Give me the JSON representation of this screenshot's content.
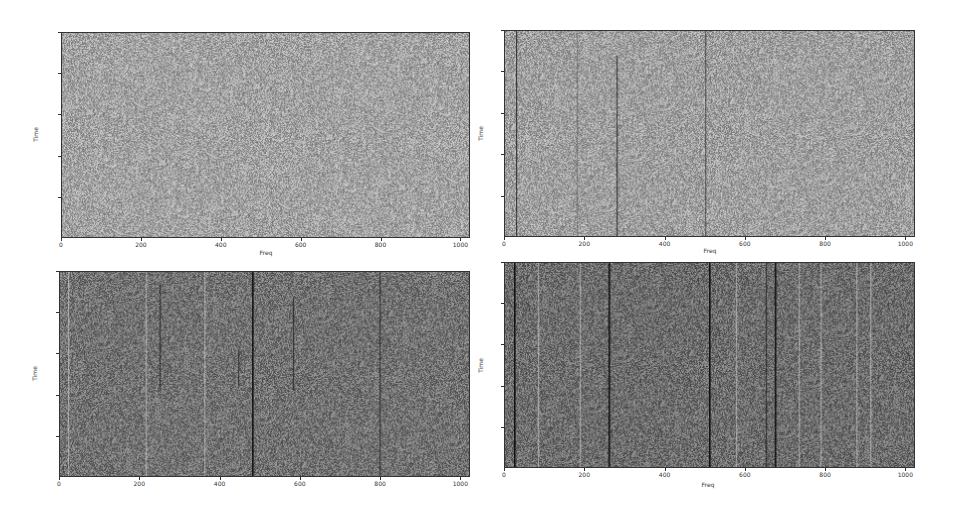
{
  "chart_data": [
    {
      "type": "heatmap",
      "panel": "top-left",
      "title": "",
      "xlabel": "Freq",
      "ylabel": "Time",
      "xlim": [
        0,
        1024
      ],
      "ylim": [
        500,
        0
      ],
      "xticks": [
        0,
        200,
        400,
        600,
        800,
        1000
      ],
      "yticks": [
        0,
        100,
        200,
        300,
        400
      ],
      "colormap": "gray",
      "background_level": "#a3a3a3",
      "description": "Uniform gray noise, no visible features",
      "lines": []
    },
    {
      "type": "heatmap",
      "panel": "top-right",
      "title": "",
      "xlabel": "Freq",
      "ylabel": "Time",
      "xlim": [
        0,
        1024
      ],
      "ylim": [
        500,
        0
      ],
      "xticks": [
        0,
        200,
        400,
        600,
        800,
        1000
      ],
      "yticks": [
        0,
        100,
        200,
        300,
        400
      ],
      "colormap": "gray",
      "background_level": "#a0a0a0",
      "description": "Gray noise with several dark vertical lines",
      "lines": [
        {
          "freq": 28,
          "t_start": 0,
          "t_end": 500,
          "shade": "dark"
        },
        {
          "freq": 180,
          "t_start": 0,
          "t_end": 500,
          "shade": "faint"
        },
        {
          "freq": 278,
          "t_start": 60,
          "t_end": 500,
          "shade": "dark"
        },
        {
          "freq": 502,
          "t_start": 0,
          "t_end": 500,
          "shade": "medium"
        }
      ]
    },
    {
      "type": "heatmap",
      "panel": "bottom-left",
      "title": "",
      "xlabel": "",
      "ylabel": "Time",
      "xlim": [
        0,
        1024
      ],
      "ylim": [
        500,
        0
      ],
      "xticks": [
        0,
        200,
        400,
        600,
        800,
        1000
      ],
      "yticks": [
        0,
        100,
        200,
        300,
        400
      ],
      "colormap": "gray",
      "background_level": "#737373",
      "description": "Darker gray noise with dark vertical lines and faint light lines",
      "lines": [
        {
          "freq": 20,
          "t_start": 0,
          "t_end": 500,
          "shade": "light"
        },
        {
          "freq": 215,
          "t_start": 0,
          "t_end": 500,
          "shade": "light"
        },
        {
          "freq": 248,
          "t_start": 30,
          "t_end": 290,
          "shade": "dark"
        },
        {
          "freq": 362,
          "t_start": 0,
          "t_end": 500,
          "shade": "light"
        },
        {
          "freq": 445,
          "t_start": 190,
          "t_end": 280,
          "shade": "dark"
        },
        {
          "freq": 482,
          "t_start": 0,
          "t_end": 500,
          "shade": "black"
        },
        {
          "freq": 582,
          "t_start": 60,
          "t_end": 290,
          "shade": "dark"
        },
        {
          "freq": 800,
          "t_start": 0,
          "t_end": 500,
          "shade": "dark"
        }
      ]
    },
    {
      "type": "heatmap",
      "panel": "bottom-right",
      "title": "",
      "xlabel": "Freq",
      "ylabel": "Time",
      "xlim": [
        0,
        1024
      ],
      "ylim": [
        500,
        0
      ],
      "xticks": [
        0,
        200,
        400,
        600,
        800,
        1000
      ],
      "yticks": [
        0,
        100,
        200,
        300,
        400
      ],
      "colormap": "gray",
      "background_level": "#6e6e6e",
      "description": "Dark gray noise with many dark and light vertical stripes",
      "lines": [
        {
          "freq": 22,
          "t_start": 0,
          "t_end": 500,
          "shade": "black"
        },
        {
          "freq": 82,
          "t_start": 0,
          "t_end": 500,
          "shade": "light"
        },
        {
          "freq": 187,
          "t_start": 0,
          "t_end": 500,
          "shade": "light"
        },
        {
          "freq": 258,
          "t_start": 0,
          "t_end": 500,
          "shade": "black"
        },
        {
          "freq": 510,
          "t_start": 0,
          "t_end": 500,
          "shade": "black"
        },
        {
          "freq": 578,
          "t_start": 0,
          "t_end": 500,
          "shade": "light"
        },
        {
          "freq": 652,
          "t_start": 0,
          "t_end": 500,
          "shade": "dark"
        },
        {
          "freq": 676,
          "t_start": 0,
          "t_end": 500,
          "shade": "black"
        },
        {
          "freq": 735,
          "t_start": 0,
          "t_end": 500,
          "shade": "light"
        },
        {
          "freq": 790,
          "t_start": 0,
          "t_end": 500,
          "shade": "light"
        },
        {
          "freq": 880,
          "t_start": 0,
          "t_end": 500,
          "shade": "light"
        },
        {
          "freq": 915,
          "t_start": 0,
          "t_end": 500,
          "shade": "light"
        }
      ]
    }
  ],
  "panels": [
    {
      "id": "top-left",
      "xlabel": "Freq",
      "ylabel": "Time",
      "xticks": [
        "0",
        "200",
        "400",
        "600",
        "800",
        "1000"
      ],
      "yticks": [
        "0",
        "100",
        "200",
        "300",
        "400"
      ]
    },
    {
      "id": "top-right",
      "xlabel": "Freq",
      "ylabel": "Time",
      "xticks": [
        "0",
        "200",
        "400",
        "600",
        "800",
        "1000"
      ],
      "yticks": [
        "0",
        "100",
        "200",
        "300",
        "400"
      ]
    },
    {
      "id": "bottom-left",
      "xlabel": "",
      "ylabel": "Time",
      "xticks": [
        "0",
        "200",
        "400",
        "600",
        "800",
        "1000"
      ],
      "yticks": [
        "0",
        "100",
        "200",
        "300",
        "400"
      ]
    },
    {
      "id": "bottom-right",
      "xlabel": "Freq",
      "ylabel": "Time",
      "xticks": [
        "0",
        "200",
        "400",
        "600",
        "800",
        "1000"
      ],
      "yticks": [
        "0",
        "100",
        "200",
        "300",
        "400"
      ]
    }
  ]
}
